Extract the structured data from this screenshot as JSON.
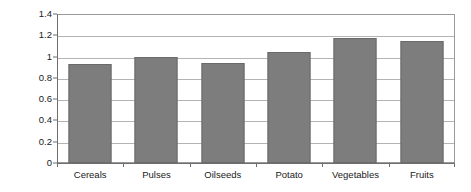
{
  "chart_data": {
    "type": "bar",
    "title": "",
    "subtitle": "",
    "xlabel": "",
    "ylabel": "",
    "categories": [
      "Cereals",
      "Pulses",
      "Oilseeds",
      "Potato",
      "Vegetables",
      "Fruits"
    ],
    "values": [
      0.93,
      1.0,
      0.94,
      1.04,
      1.17,
      1.15
    ],
    "series": [
      {
        "name": "",
        "values": [
          0.93,
          1.0,
          0.94,
          1.04,
          1.17,
          1.15
        ]
      }
    ],
    "ylim": [
      0,
      1.4
    ],
    "ytick_labels": [
      "0",
      "0.2",
      "0.4",
      "0.6",
      "0.8",
      "1",
      "1.2",
      "1.4"
    ],
    "ytick_values": [
      0,
      0.2,
      0.4,
      0.6,
      0.8,
      1.0,
      1.2,
      1.4
    ],
    "grid": true,
    "grid_axis": "y",
    "legend": false,
    "legend_position": "none",
    "annotations": [],
    "colors": {
      "bar_fill": "#7d7d7d",
      "bar_border": "#6a6a6a",
      "gridline": "#b4b4b4",
      "axis": "#6e6e6e",
      "plot_border": "#9a9a9a",
      "background": "#ffffff",
      "text": "#1a1a1a"
    }
  }
}
